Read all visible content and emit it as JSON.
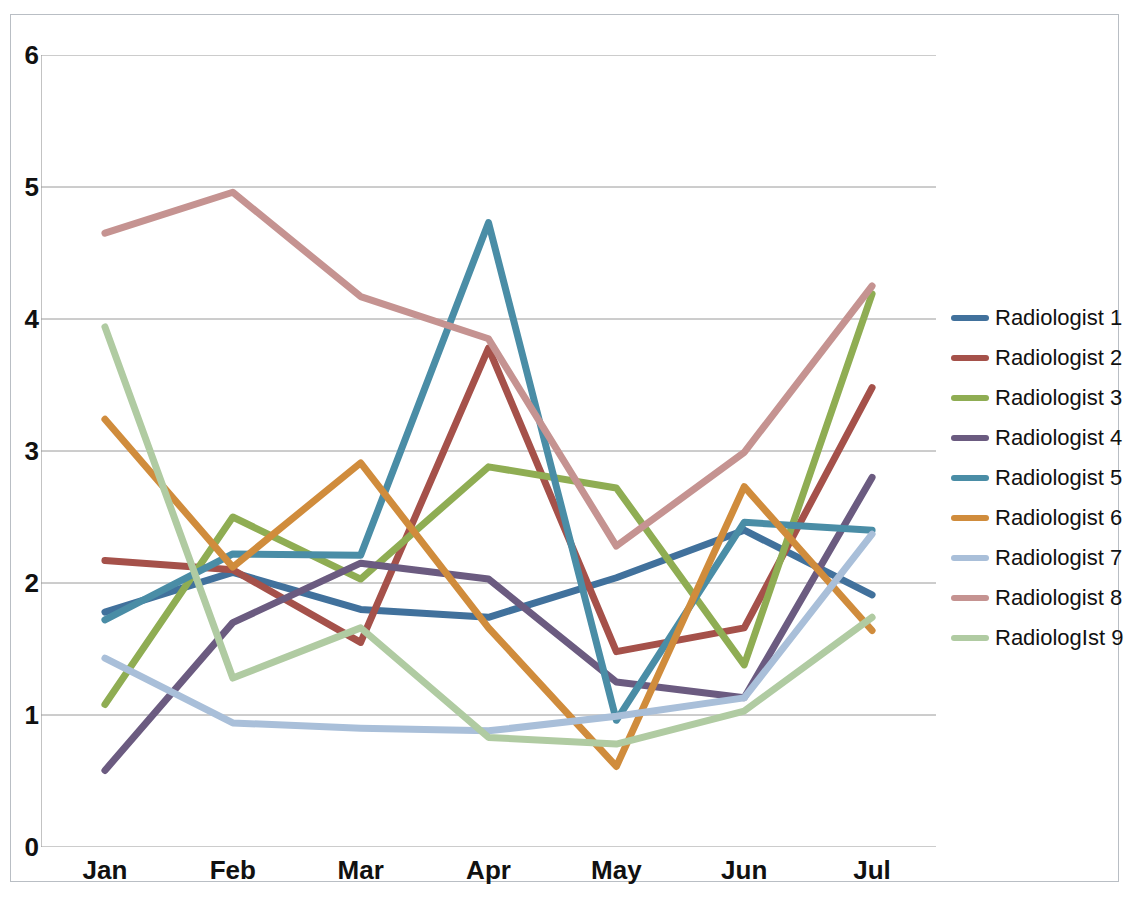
{
  "chart_data": {
    "type": "line",
    "title": "",
    "xlabel": "",
    "ylabel": "",
    "categories": [
      "Jan",
      "Feb",
      "Mar",
      "Apr",
      "May",
      "Jun",
      "Jul"
    ],
    "ylim": [
      0,
      6
    ],
    "yticks": [
      0,
      1,
      2,
      3,
      4,
      5,
      6
    ],
    "grid": true,
    "legend_position": "right",
    "series": [
      {
        "name": "Radiologist 1",
        "color": "#41719C",
        "values": [
          1.78,
          2.08,
          1.8,
          1.74,
          2.04,
          2.4,
          1.91
        ]
      },
      {
        "name": "Radiologist 2",
        "color": "#A5514A",
        "values": [
          2.17,
          2.1,
          1.55,
          3.78,
          1.48,
          1.66,
          3.48
        ]
      },
      {
        "name": "Radiologist 3",
        "color": "#8FAD53",
        "values": [
          1.08,
          2.5,
          2.03,
          2.88,
          2.72,
          1.38,
          4.19
        ]
      },
      {
        "name": "Radiologist 4",
        "color": "#6B5B80",
        "values": [
          0.58,
          1.7,
          2.15,
          2.03,
          1.25,
          1.13,
          2.8
        ]
      },
      {
        "name": "Radiologist 5",
        "color": "#4A8DA6",
        "values": [
          1.72,
          2.22,
          2.21,
          4.73,
          0.96,
          2.46,
          2.4
        ]
      },
      {
        "name": "Radiologist 6",
        "color": "#D08C3C",
        "values": [
          3.24,
          2.12,
          2.91,
          1.66,
          0.61,
          2.73,
          1.64
        ]
      },
      {
        "name": "Radiologist 7",
        "color": "#A9BFD9",
        "values": [
          1.43,
          0.94,
          0.9,
          0.88,
          0.99,
          1.13,
          2.37
        ]
      },
      {
        "name": "Radiologist 8",
        "color": "#C59391",
        "values": [
          4.65,
          4.96,
          4.17,
          3.85,
          2.28,
          2.99,
          4.25
        ]
      },
      {
        "name": "RadiologIst 9",
        "color": "#B0CBA2",
        "values": [
          3.94,
          1.28,
          1.66,
          0.83,
          0.78,
          1.03,
          1.74
        ]
      }
    ]
  },
  "axes": {
    "y_tick_labels": [
      "6",
      "5",
      "4",
      "3",
      "2",
      "1",
      "0"
    ],
    "x_tick_labels": [
      "Jan",
      "Feb",
      "Mar",
      "Apr",
      "May",
      "Jun",
      "Jul"
    ]
  }
}
